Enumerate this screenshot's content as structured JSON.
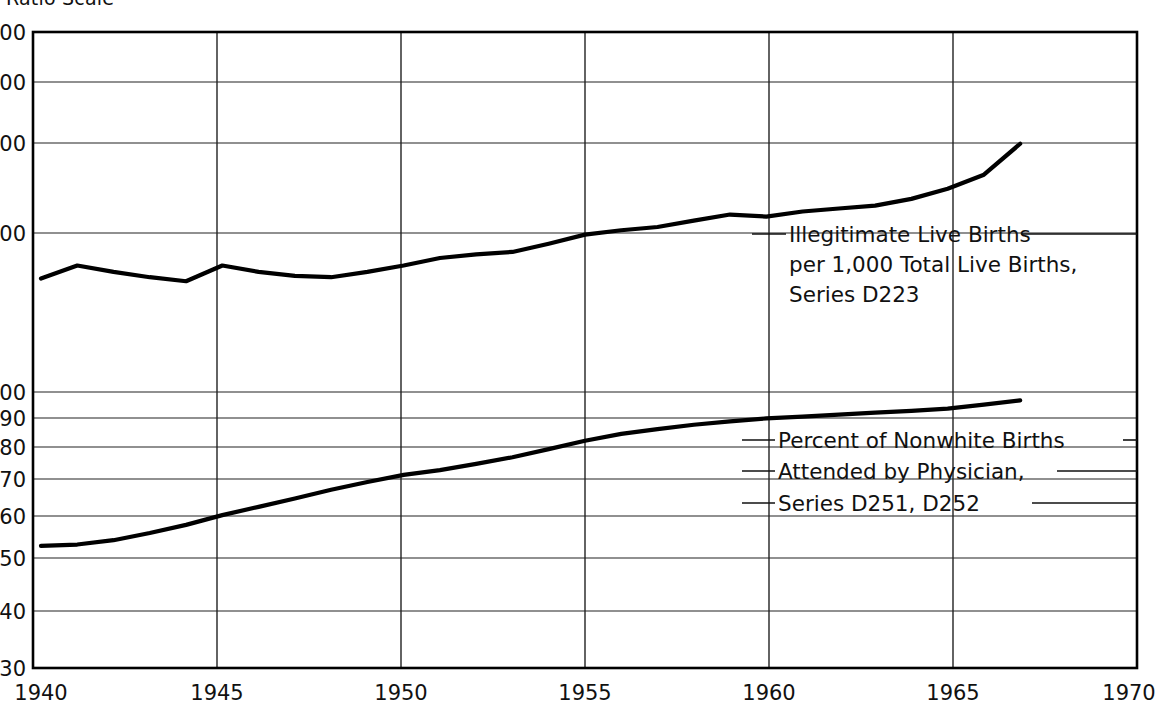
{
  "figure": {
    "scale_note": "Ratio Scale",
    "background": "#ffffff",
    "line_color": "#000000"
  },
  "axes": {
    "y_ticks": [
      "500",
      "400",
      "300",
      "200",
      "100",
      "90",
      "80",
      "70",
      "60",
      "50",
      "40",
      "30"
    ],
    "x_ticks": [
      "1940",
      "1945",
      "1950",
      "1955",
      "1960",
      "1965",
      "1970"
    ],
    "y_min": 30,
    "y_max": 500,
    "x_min": 1940,
    "x_max": 1970,
    "y_scale": "log"
  },
  "annotations": {
    "upper": {
      "line1": "Illegitimate Live Births",
      "line2": "per 1,000 Total Live Births,",
      "line3": "Series D223"
    },
    "lower": {
      "line1": "Percent of Nonwhite Births",
      "line2": "Attended by Physician,",
      "line3": "Series D251, D252"
    }
  },
  "chart_data": {
    "type": "line",
    "title": "",
    "subtitle": "",
    "xlabel": "",
    "ylabel": "",
    "scale_note": "Ratio Scale",
    "yscale": "log",
    "xlim": [
      1940,
      1970
    ],
    "ylim": [
      30,
      500
    ],
    "grid": true,
    "legend": "inline annotations",
    "y_tick_values": [
      500,
      400,
      300,
      200,
      100,
      90,
      80,
      70,
      60,
      50,
      40,
      30
    ],
    "x_tick_values": [
      1940,
      1945,
      1950,
      1955,
      1960,
      1965,
      1970
    ],
    "series": [
      {
        "name": "Illegitimate Live Births per 1,000 Total Live Births, Series D223",
        "label_lines": [
          "Illegitimate Live Births",
          "per 1,000 Total Live Births,",
          "Series D223"
        ],
        "x": [
          1940,
          1941,
          1942,
          1943,
          1944,
          1945,
          1946,
          1947,
          1948,
          1949,
          1950,
          1951,
          1952,
          1953,
          1954,
          1955,
          1956,
          1957,
          1958,
          1959,
          1960,
          1961,
          1962,
          1963,
          1964,
          1965,
          1966,
          1967
        ],
        "values": [
          168,
          178,
          173,
          169,
          166,
          178,
          173,
          170,
          169,
          173,
          178,
          184,
          187,
          189,
          196,
          204,
          208,
          211,
          217,
          223,
          221,
          226,
          229,
          232,
          239,
          250,
          266,
          305
        ]
      },
      {
        "name": "Percent of Nonwhite Births Attended by Physician, Series D251, D252",
        "label_lines": [
          "Percent of Nonwhite Births",
          "Attended by Physician,",
          "Series D251, D252"
        ],
        "x": [
          1940,
          1941,
          1942,
          1943,
          1944,
          1945,
          1946,
          1947,
          1948,
          1949,
          1950,
          1951,
          1952,
          1953,
          1954,
          1955,
          1956,
          1957,
          1958,
          1959,
          1960,
          1961,
          1962,
          1963,
          1964,
          1965,
          1966,
          1967
        ],
        "values": [
          51.5,
          51.8,
          52.8,
          54.5,
          56.5,
          59.0,
          61.2,
          63.5,
          66.0,
          68.3,
          70.5,
          72.0,
          74.0,
          76.2,
          79.0,
          82.0,
          84.5,
          86.3,
          88.0,
          89.3,
          90.5,
          91.2,
          92.0,
          92.8,
          93.6,
          94.5,
          96.2,
          98.0
        ]
      }
    ]
  }
}
